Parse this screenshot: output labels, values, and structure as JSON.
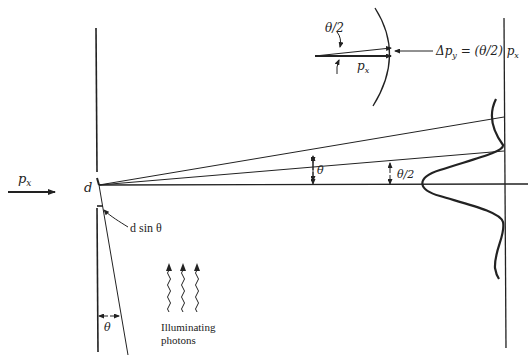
{
  "labels": {
    "incident_momentum": "p",
    "incident_momentum_sub": "x",
    "slit_width": "d",
    "path_difference": "d sin θ",
    "angle_full": "θ",
    "angle_half": "θ/2",
    "angle_bottom": "θ",
    "inset_angle": "θ/2",
    "inset_momentum": "p",
    "inset_momentum_sub": "x",
    "inset_equation_prefix": "Δp",
    "inset_equation_sub": "y",
    "inset_equation_rest": " = (θ/2) p",
    "inset_equation_sub2": "x",
    "photons_line1": "Illuminating",
    "photons_line2": "photons"
  },
  "colors": {
    "ink": "#222222",
    "background": "#ffffff"
  }
}
